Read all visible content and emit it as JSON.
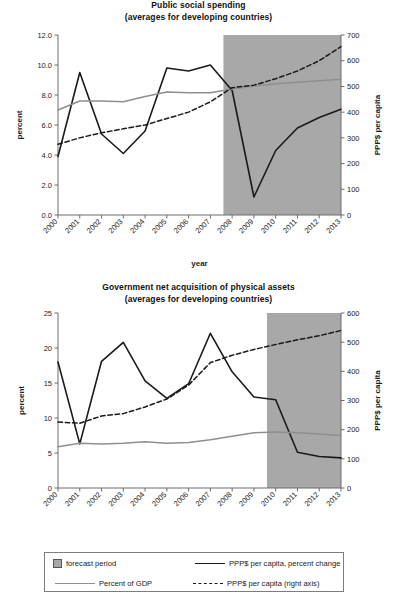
{
  "figure": {
    "x_axis_title": "year",
    "left_axis_title": "percent",
    "right_axis_title": "PPP$ per capita"
  },
  "legend": {
    "forecast_label": "forecast period",
    "percent_gdp_label": "Percent of GDP",
    "ppp_change_label": "PPP$ per capita, percent change",
    "ppp_level_label": "PPP$ per capita (right axis)"
  },
  "colors": {
    "shade": "#a8a8a8",
    "line_black": "#1a1a1a",
    "line_gray": "#8f8f8f",
    "axis": "#6d6d6d"
  },
  "chart_data": [
    {
      "type": "line",
      "id": "public-social-spending",
      "title": "Public social spending",
      "subtitle": "(averages for developing countries)",
      "xlabel": "year",
      "ylabel": "percent",
      "y2label": "PPP$ per capita",
      "categories": [
        "2000",
        "2001",
        "2002",
        "2003",
        "2004",
        "2005",
        "2006",
        "2007",
        "2008",
        "2009",
        "2010",
        "2011",
        "2012",
        "2013"
      ],
      "xlim": [
        2000,
        2013
      ],
      "ylim": [
        0.0,
        12.0
      ],
      "yticks": [
        "0.0",
        "2.0",
        "4.0",
        "6.0",
        "8.0",
        "10.0",
        "12.0"
      ],
      "y2lim": [
        0,
        700
      ],
      "y2ticks": [
        "0",
        "100",
        "200",
        "300",
        "400",
        "500",
        "600",
        "700"
      ],
      "grid": false,
      "forecast_start": 2007.6,
      "forecast_end": 2013.0,
      "legend_position": "bottom",
      "series": [
        {
          "name": "PPP$ per capita, percent change",
          "axis": "left",
          "style": "solid-black",
          "values": [
            3.9,
            9.5,
            5.4,
            4.1,
            5.6,
            9.8,
            9.6,
            10.0,
            8.3,
            1.2,
            4.3,
            5.8,
            6.5,
            7.05
          ]
        },
        {
          "name": "Percent of GDP",
          "axis": "left",
          "style": "solid-gray",
          "values": [
            7.0,
            7.6,
            7.6,
            7.55,
            7.9,
            8.2,
            8.15,
            8.15,
            8.4,
            8.6,
            8.75,
            8.85,
            8.95,
            9.05
          ]
        },
        {
          "name": "PPP$ per capita (right axis)",
          "axis": "right",
          "style": "dashed-black",
          "values": [
            275,
            300,
            320,
            335,
            350,
            375,
            400,
            440,
            495,
            505,
            530,
            560,
            600,
            655
          ]
        }
      ]
    },
    {
      "type": "line",
      "id": "government-net-acquisition-physical-assets",
      "title": "Government  net acquisition of physical assets",
      "subtitle": "(averages for developing countries)",
      "xlabel": "year",
      "ylabel": "percent",
      "y2label": "PPP$ per capita",
      "categories": [
        "2000",
        "2001",
        "2002",
        "2003",
        "2004",
        "2005",
        "2006",
        "2007",
        "2008",
        "2009",
        "2010",
        "2011",
        "2012",
        "2013"
      ],
      "xlim": [
        2000,
        2013
      ],
      "ylim": [
        0,
        25
      ],
      "yticks": [
        "0",
        "5",
        "10",
        "15",
        "20",
        "25"
      ],
      "y2lim": [
        0,
        600
      ],
      "y2ticks": [
        "0",
        "100",
        "200",
        "300",
        "400",
        "500",
        "600"
      ],
      "grid": false,
      "forecast_start": 2009.6,
      "forecast_end": 2013.0,
      "legend_position": "bottom",
      "series": [
        {
          "name": "PPP$ per capita, percent change",
          "axis": "left",
          "style": "solid-black",
          "values": [
            18.0,
            6.3,
            18.1,
            20.8,
            15.3,
            12.8,
            14.9,
            22.1,
            16.6,
            13.0,
            12.6,
            5.1,
            4.5,
            4.3
          ]
        },
        {
          "name": "Percent of GDP",
          "axis": "left",
          "style": "solid-gray",
          "values": [
            5.9,
            6.4,
            6.3,
            6.4,
            6.6,
            6.4,
            6.5,
            6.9,
            7.4,
            7.9,
            8.0,
            7.9,
            7.7,
            7.5
          ]
        },
        {
          "name": "PPP$ per capita (right axis)",
          "axis": "right",
          "style": "dashed-black",
          "values": [
            226,
            222,
            247,
            255,
            278,
            305,
            353,
            430,
            455,
            475,
            492,
            508,
            522,
            540
          ]
        }
      ]
    }
  ]
}
